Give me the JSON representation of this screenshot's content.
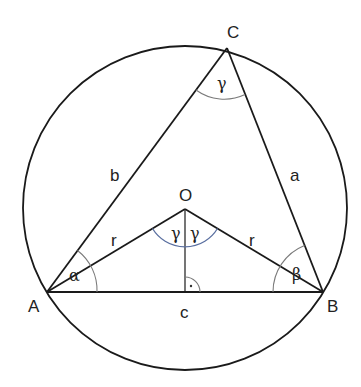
{
  "diagram": {
    "colors": {
      "stroke": "#1a1a1a",
      "angle_arc": "#7a7a7a",
      "central_angle_arc": "#5a6fa0",
      "background": "#ffffff"
    },
    "circle": {
      "cx": 185,
      "cy": 208,
      "r": 162
    },
    "points": {
      "A": {
        "x": 47,
        "y": 292,
        "label": "A"
      },
      "B": {
        "x": 323,
        "y": 292,
        "label": "B"
      },
      "C": {
        "x": 227,
        "y": 48,
        "label": "C"
      },
      "O": {
        "x": 185,
        "y": 209,
        "label": "O"
      },
      "F": {
        "x": 185,
        "y": 292
      }
    },
    "side_labels": {
      "a": "a",
      "b": "b",
      "c": "c"
    },
    "radius_labels": {
      "left": "r",
      "right": "r"
    },
    "angle_labels": {
      "alpha": "α",
      "beta": "β",
      "gamma_C": "γ",
      "gamma_O_left": "γ",
      "gamma_O_right": "γ"
    },
    "right_angle_marker": "·"
  }
}
